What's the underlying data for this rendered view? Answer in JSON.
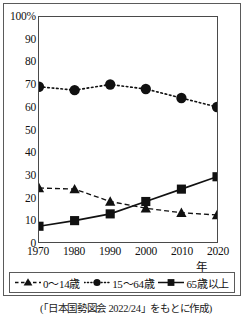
{
  "figure": {
    "caption": "(「日本国勢図会 2022/24」をもとに作成)"
  },
  "axes": {
    "y_top_label": "100%",
    "y_ticks": [
      "100%",
      "90",
      "80",
      "70",
      "60",
      "50",
      "40",
      "30",
      "20",
      "10",
      "0"
    ],
    "x_unit_label": "年",
    "x_ticks": [
      "1970",
      "1980",
      "1990",
      "2000",
      "2010",
      "2020"
    ]
  },
  "legend": {
    "items": [
      {
        "label": "0〜14歳",
        "marker": "triangle-marker",
        "line": "dashed"
      },
      {
        "label": "15〜64歳",
        "marker": "circle-marker",
        "line": "dotted"
      },
      {
        "label": "65歳以上",
        "marker": "square-marker",
        "line": "solid"
      }
    ]
  },
  "chart_data": {
    "type": "line",
    "title": "",
    "xlabel": "年",
    "ylabel": "%",
    "x": [
      1970,
      1980,
      1990,
      2000,
      2010,
      2020
    ],
    "categories": [
      "1970",
      "1980",
      "1990",
      "2000",
      "2010",
      "2020"
    ],
    "xlim": [
      1970,
      2020
    ],
    "ylim": [
      0,
      100
    ],
    "ytick_step": 10,
    "grid": false,
    "legend_position": "bottom",
    "series": [
      {
        "name": "0〜14歳",
        "marker": "triangle",
        "linestyle": "dashed",
        "values": [
          24,
          23.5,
          18,
          15,
          13,
          12
        ]
      },
      {
        "name": "15〜64歳",
        "marker": "circle",
        "linestyle": "dotted",
        "values": [
          69,
          67.5,
          70,
          68,
          64,
          60
        ]
      },
      {
        "name": "65歳以上",
        "marker": "square",
        "linestyle": "solid",
        "values": [
          7,
          9.5,
          12.5,
          18,
          23.5,
          29
        ]
      }
    ]
  },
  "colors": {
    "ink": "#111111",
    "frame": "#5a5a5a",
    "axis": "#4a4a4a",
    "background": "#ffffff"
  }
}
